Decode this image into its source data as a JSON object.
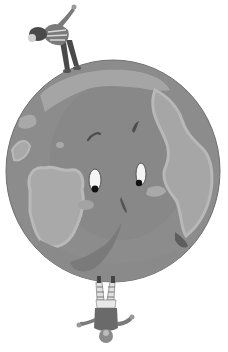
{
  "illustration": {
    "subject": "Cartoon Earth globe with a face, one person standing on top and one person hanging upside down from the bottom",
    "style": "grayscale illustration",
    "colors": {
      "background": "#ffffff",
      "ocean": "#8c8c8c",
      "ocean_shade": "#7e7e7e",
      "land": "#a9a9a9",
      "land_edge": "#b8b8b8",
      "outline": "#6a6a6a",
      "eye_white": "#f4f4f4",
      "pupil": "#111111",
      "figure_dark": "#4a4a4a",
      "figure_mid": "#7a7a7a",
      "figure_light": "#d8d8d8"
    },
    "globe": {
      "cx": 113,
      "cy": 171,
      "rx": 107,
      "ry": 111,
      "expression": "worried face with two eyes looking down-left, brows and a nose"
    },
    "figures": [
      {
        "name": "top-person",
        "pose": "standing on top of globe, leaning forward with one arm raised",
        "clothing": "striped sweater, dark trousers"
      },
      {
        "name": "bottom-person",
        "pose": "hanging upside down beneath globe, arms spread",
        "clothing": "striped trousers, dark top"
      }
    ]
  }
}
